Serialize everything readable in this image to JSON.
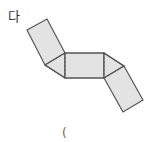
{
  "figure": {
    "label": "다",
    "mark": "(",
    "fill_color": "#e3e3e3",
    "stroke_color": "#555555"
  }
}
